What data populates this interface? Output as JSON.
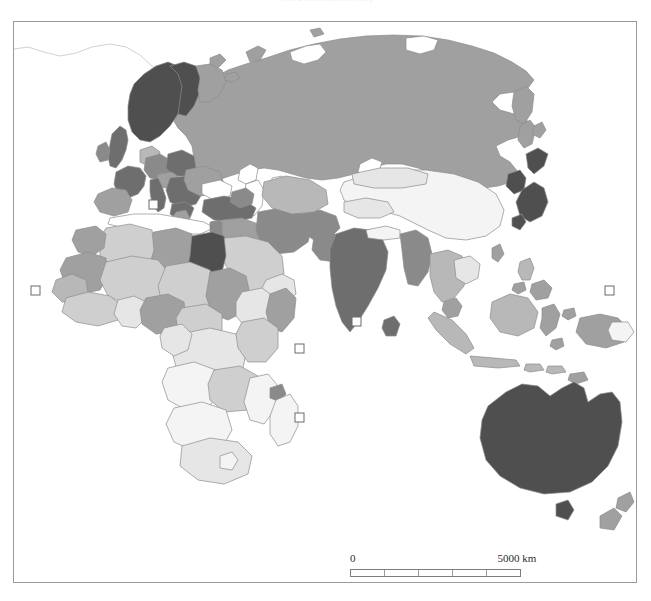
{
  "caption": {
    "text": "World distribution map"
  },
  "map": {
    "title": "Eastern Hemisphere choropleth map",
    "projection_note": "Europe, Africa, Asia and Oceania",
    "frame": {
      "stroke": "#9a9a9a",
      "background": "#ffffff"
    },
    "shading": {
      "very_dark": "#4f4f4f",
      "dark": "#6e6e6e",
      "medium_dark": "#8a8a8a",
      "medium": "#a0a0a0",
      "medium_light": "#b8b8b8",
      "light": "#cfcfcf",
      "very_light": "#e6e6e6",
      "near_white": "#f4f4f4",
      "outline": "#8c8c8c"
    },
    "markers": {
      "label": "small-square-marker",
      "fill": "#ffffff",
      "stroke": "#6a6a6a",
      "size": 9,
      "positions": [
        {
          "name": "marker-atlantic-west-africa",
          "x": 34,
          "y": 289
        },
        {
          "name": "marker-mediterranean",
          "x": 152,
          "y": 203
        },
        {
          "name": "marker-indian-ocean-north",
          "x": 355,
          "y": 320
        },
        {
          "name": "marker-gulf-of-guinea",
          "x": 298,
          "y": 347
        },
        {
          "name": "marker-indian-ocean-south",
          "x": 298,
          "y": 416
        },
        {
          "name": "marker-pacific-east",
          "x": 608,
          "y": 289
        }
      ]
    },
    "regions": [
      {
        "name": "russia",
        "tone": "medium"
      },
      {
        "name": "scandinavia",
        "tone": "very_dark"
      },
      {
        "name": "united-kingdom",
        "tone": "dark"
      },
      {
        "name": "france",
        "tone": "dark"
      },
      {
        "name": "germany",
        "tone": "medium_dark"
      },
      {
        "name": "poland",
        "tone": "dark"
      },
      {
        "name": "spain",
        "tone": "medium"
      },
      {
        "name": "italy",
        "tone": "dark"
      },
      {
        "name": "turkey",
        "tone": "dark"
      },
      {
        "name": "egypt",
        "tone": "very_dark"
      },
      {
        "name": "sahara-belt",
        "tone": "light"
      },
      {
        "name": "west-africa",
        "tone": "medium_light"
      },
      {
        "name": "central-africa",
        "tone": "very_light"
      },
      {
        "name": "southern-africa",
        "tone": "near_white"
      },
      {
        "name": "saudi-arabia",
        "tone": "light"
      },
      {
        "name": "iran",
        "tone": "medium_dark"
      },
      {
        "name": "india",
        "tone": "dark"
      },
      {
        "name": "china",
        "tone": "near_white"
      },
      {
        "name": "japan",
        "tone": "very_dark"
      },
      {
        "name": "korea",
        "tone": "very_dark"
      },
      {
        "name": "southeast-asia",
        "tone": "medium_light"
      },
      {
        "name": "indonesia",
        "tone": "medium_light"
      },
      {
        "name": "australia",
        "tone": "very_dark"
      },
      {
        "name": "new-zealand",
        "tone": "medium"
      },
      {
        "name": "madagascar",
        "tone": "near_white"
      }
    ]
  },
  "scalebar": {
    "zero_label": "0",
    "max_label": "5000 km",
    "segments": 5,
    "unit": "km",
    "max_value": 5000
  }
}
